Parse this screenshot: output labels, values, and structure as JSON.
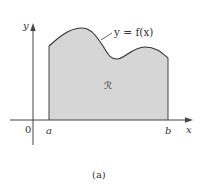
{
  "figure": {
    "caption": "(a)",
    "curve_label": "y = f(x)",
    "region_label": "ℛ",
    "axes": {
      "x_label": "x",
      "y_label": "y",
      "origin_label": "0"
    },
    "x_ticks": [
      {
        "label": "a"
      },
      {
        "label": "b"
      }
    ],
    "colors": {
      "region_fill": "#d6d6d6",
      "curve_stroke": "#333333",
      "axis_stroke": "#444444",
      "background": "#ffffff"
    }
  }
}
